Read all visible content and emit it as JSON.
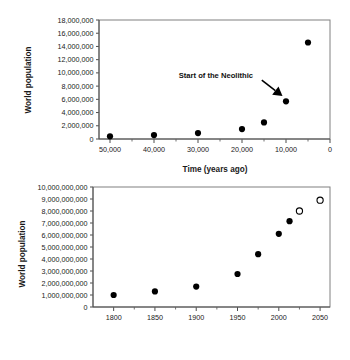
{
  "figure": {
    "title": "",
    "background": "#ffffff",
    "point_color": "#000000",
    "frame_color": "#808080"
  },
  "chart_data": [
    {
      "id": "prehistoric-population",
      "type": "scatter",
      "title": "",
      "xlabel": "Time (years ago)",
      "ylabel": "World population",
      "xlim": [
        52500,
        0
      ],
      "ylim": [
        0,
        18000000
      ],
      "x_inverted": true,
      "grid": false,
      "legend": "none",
      "xticks": [
        50000,
        40000,
        30000,
        20000,
        10000,
        0
      ],
      "xticklabels": [
        "50,000",
        "40,000",
        "30,000",
        "20,000",
        "10,000",
        "0"
      ],
      "xminor_ticks": [
        45000,
        35000,
        25000,
        15000,
        5000
      ],
      "yticks": [
        0,
        2000000,
        4000000,
        6000000,
        8000000,
        10000000,
        12000000,
        14000000,
        16000000,
        18000000
      ],
      "yticklabels": [
        "0",
        "2,000,000",
        "4,000,000",
        "6,000,000",
        "8,000,000",
        "10,000,000",
        "12,000,000",
        "14,000,000",
        "16,000,000",
        "18,000,000"
      ],
      "x": [
        50000,
        40000,
        30000,
        20000,
        15000,
        10000,
        5000
      ],
      "values": [
        400000,
        600000,
        900000,
        1500000,
        2500000,
        5700000,
        14600000
      ],
      "marker": "filled-circle",
      "annotations": [
        {
          "text": "Start of the Neolithic",
          "text_x": 17500,
          "text_y": 9200000,
          "arrow_from_x": 15500,
          "arrow_from_y": 8900000,
          "arrow_to_x": 10800,
          "arrow_to_y": 6500000
        }
      ]
    },
    {
      "id": "modern-population",
      "type": "scatter",
      "title": "",
      "xlabel": "",
      "ylabel": "World population",
      "xlim": [
        1775,
        2062
      ],
      "ylim": [
        0,
        10000000000
      ],
      "grid": false,
      "legend": "none",
      "xticks": [
        1800,
        1850,
        1900,
        1950,
        2000,
        2050
      ],
      "xticklabels": [
        "1800",
        "1850",
        "1900",
        "1950",
        "2000",
        "2050"
      ],
      "xminor_ticks": [
        1825,
        1875,
        1925,
        1975,
        2025
      ],
      "yticks": [
        0,
        1000000000,
        2000000000,
        3000000000,
        4000000000,
        5000000000,
        6000000000,
        7000000000,
        8000000000,
        9000000000,
        10000000000
      ],
      "yticklabels": [
        "0",
        "1,000,000,000",
        "2,000,000,000",
        "3,000,000,000",
        "4,000,000,000",
        "5,000,000,000",
        "6,000,000,000",
        "7,000,000,000",
        "8,000,000,000",
        "9,000,000,000",
        "10,000,000,000"
      ],
      "series": [
        {
          "name": "observed",
          "marker": "filled-circle",
          "x": [
            1800,
            1850,
            1900,
            1950,
            1975,
            2000,
            2013
          ],
          "values": [
            1000000000,
            1300000000,
            1700000000,
            2750000000,
            4400000000,
            6100000000,
            7150000000
          ]
        },
        {
          "name": "projected",
          "marker": "open-circle",
          "x": [
            2025,
            2050
          ],
          "values": [
            8000000000,
            8900000000
          ]
        }
      ]
    }
  ]
}
